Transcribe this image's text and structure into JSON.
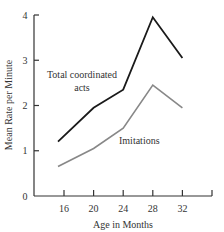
{
  "chart_data": {
    "type": "line",
    "title": "",
    "xlabel": "Age in Months",
    "ylabel": "Mean Rate per Minute",
    "x": [
      15,
      20,
      24,
      28,
      32
    ],
    "series": [
      {
        "name": "Total coordinated acts",
        "label_lines": [
          "Total coordinated",
          "acts"
        ],
        "values": [
          1.2,
          1.95,
          2.35,
          3.95,
          3.05
        ],
        "color": "#1a1a1a"
      },
      {
        "name": "Imitations",
        "label_lines": [
          "Imitations"
        ],
        "values": [
          0.65,
          1.05,
          1.5,
          2.45,
          1.95
        ],
        "color": "#888888"
      }
    ],
    "xticks": [
      16,
      20,
      24,
      28,
      32,
      36
    ],
    "xtick_labels": [
      "16",
      "20",
      "24",
      "28",
      "32",
      ""
    ],
    "yticks": [
      0,
      1,
      2,
      3,
      4
    ],
    "ytick_labels": [
      "0",
      "1",
      "2",
      "3",
      "4"
    ],
    "xlim": [
      12,
      36
    ],
    "ylim": [
      0,
      4
    ],
    "grid": false,
    "legend": "inline labels"
  }
}
